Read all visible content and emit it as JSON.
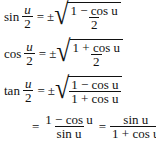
{
  "formulas": [
    {
      "lhs_fn": "sin",
      "lhs_num": "u",
      "lhs_den": "2",
      "equals": "=",
      "pm": "±",
      "rad_num": "1 − cos u",
      "rad_den": "2"
    },
    {
      "lhs_fn": "cos",
      "lhs_num": "u",
      "lhs_den": "2",
      "equals": "=",
      "pm": "±",
      "rad_num": "1 + cos u",
      "rad_den": "2"
    },
    {
      "lhs_fn": "tan",
      "lhs_num": "u",
      "lhs_den": "2",
      "equals": "=",
      "pm": "±",
      "rad_num": "1 − cos u",
      "rad_den": "1 + cos u"
    }
  ],
  "tan_alt": {
    "equals1": "=",
    "f1_num": "1 − cos u",
    "f1_den": "sin u",
    "equals2": "=",
    "f2_num": "sin u",
    "f2_den": "1 + cos u"
  }
}
